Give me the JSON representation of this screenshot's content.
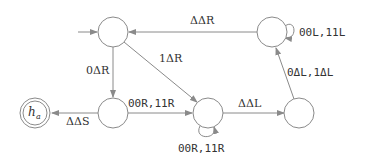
{
  "diagram": {
    "type": "turing-machine-state-diagram",
    "states": [
      {
        "id": "q0",
        "label": "",
        "start": true
      },
      {
        "id": "q1",
        "label": ""
      },
      {
        "id": "q2",
        "label": ""
      },
      {
        "id": "q3",
        "label": ""
      },
      {
        "id": "q4",
        "label": ""
      },
      {
        "id": "ha",
        "label_main": "h",
        "label_sub": "a",
        "accepting": true
      }
    ],
    "transitions": [
      {
        "from": "q4",
        "to": "q0",
        "label": "ΔΔR"
      },
      {
        "from": "q4",
        "to": "q4",
        "label": "00L,11L"
      },
      {
        "from": "q0",
        "to": "q1",
        "label": "0ΔR"
      },
      {
        "from": "q0",
        "to": "q2",
        "label": "1ΔR"
      },
      {
        "from": "q1",
        "to": "q2",
        "label": "00R,11R"
      },
      {
        "from": "q1",
        "to": "ha",
        "label": "ΔΔS"
      },
      {
        "from": "q2",
        "to": "q2",
        "label": "00R,11R"
      },
      {
        "from": "q2",
        "to": "q3",
        "label": "ΔΔL"
      },
      {
        "from": "q3",
        "to": "q4",
        "label": "0ΔL,1ΔL"
      }
    ]
  }
}
